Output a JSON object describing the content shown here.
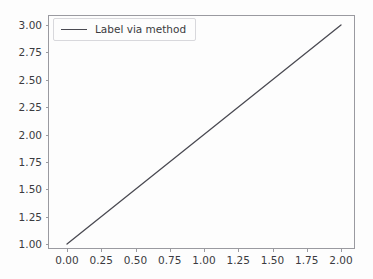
{
  "figure": {
    "width": 373,
    "height": 279,
    "background_color": "#fdfdfd"
  },
  "chart_data": {
    "type": "line",
    "title": "",
    "xlabel": "",
    "ylabel": "",
    "xlim": [
      0.0,
      2.0
    ],
    "ylim": [
      1.0,
      3.0
    ],
    "grid": false,
    "legend_position": "upper left",
    "xticks": [
      0.0,
      0.25,
      0.5,
      0.75,
      1.0,
      1.25,
      1.5,
      1.75,
      2.0
    ],
    "yticks": [
      1.0,
      1.25,
      1.5,
      1.75,
      2.0,
      2.25,
      2.5,
      2.75,
      3.0
    ],
    "xticklabels": [
      "0.00",
      "0.25",
      "0.50",
      "0.75",
      "1.00",
      "1.25",
      "1.50",
      "1.75",
      "2.00"
    ],
    "yticklabels": [
      "1.00",
      "1.25",
      "1.50",
      "1.75",
      "2.00",
      "2.25",
      "2.50",
      "2.75",
      "3.00"
    ],
    "series": [
      {
        "name": "Label via method",
        "color": "#4a4a52",
        "linewidth": 1.3,
        "linestyle": "solid",
        "x": [
          0.0,
          2.0
        ],
        "y": [
          1.0,
          3.0
        ]
      }
    ]
  },
  "legend": {
    "entries": [
      {
        "label": "Label via method",
        "color": "#4a4a52"
      }
    ]
  },
  "colors": {
    "line": "#4a4a52",
    "spine": "#9a9aa0",
    "tick_label": "#3b3b40",
    "legend_border": "#d8d8dc",
    "legend_background": "#fdfdfd"
  }
}
